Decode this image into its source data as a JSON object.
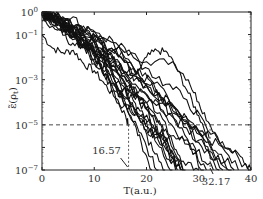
{
  "chart_data": {
    "type": "line",
    "title": "",
    "xlabel": "T(a.u.)",
    "ylabel": "ε̃(ρ_t)",
    "xlim": [
      0,
      40
    ],
    "ylim_log10": [
      -7,
      0
    ],
    "yscale": "log",
    "x_ticks": [
      "0",
      "10",
      "20",
      "30",
      "40"
    ],
    "y_ticks": [
      {
        "base": "10",
        "exp": "0",
        "log": 0
      },
      {
        "base": "10",
        "exp": "−1",
        "log": -1
      },
      {
        "base": "10",
        "exp": "−3",
        "log": -3
      },
      {
        "base": "10",
        "exp": "−5",
        "log": -5
      },
      {
        "base": "10",
        "exp": "−7",
        "log": -7
      }
    ],
    "threshold_line": {
      "y": 1e-05,
      "style": "dashed"
    },
    "annotations": [
      {
        "text": "16.57",
        "x": 16.57,
        "style": "dashed-vertical"
      },
      {
        "text": "32.17",
        "x": 32.17,
        "style": "dashed-vertical"
      }
    ],
    "series_description": "Many (~25) noisy decaying trajectories starting near 10^0 at T=0, falling to 10^-7 between T≈16 and T≈40",
    "series": [
      {
        "name": "fastest",
        "x": [
          0,
          2,
          4,
          6,
          8,
          10,
          12,
          14,
          16,
          16.57
        ],
        "log10_y": [
          -1,
          -1.6,
          -1.8,
          -1.7,
          -2.3,
          -2.6,
          -3.2,
          -3.8,
          -4.6,
          -5
        ]
      },
      {
        "name": "second",
        "x": [
          0,
          3,
          5,
          7,
          9,
          11,
          13,
          15,
          17,
          19,
          21
        ],
        "log10_y": [
          -0.4,
          -0.8,
          -1.0,
          -1.0,
          -1.6,
          -2.3,
          -2.8,
          -3.6,
          -4.6,
          -5.8,
          -7
        ]
      },
      {
        "name": "bulk-upper",
        "x": [
          0,
          5,
          10,
          15,
          20,
          25,
          28,
          30,
          32.17,
          35,
          38,
          40
        ],
        "log10_y": [
          0,
          -0.5,
          -1.0,
          -1.6,
          -2.2,
          -2.2,
          -3.0,
          -4.0,
          -5,
          -6,
          -6.4,
          -7
        ]
      },
      {
        "name": "bump",
        "x": [
          0,
          5,
          10,
          15,
          18,
          20,
          22,
          24,
          26,
          28,
          30,
          32
        ],
        "log10_y": [
          0,
          -0.6,
          -1.2,
          -2.0,
          -2.8,
          -2.0,
          -1.7,
          -1.8,
          -2.6,
          -3.6,
          -4.6,
          -5.6
        ]
      },
      {
        "name": "bulk-lower",
        "x": [
          0,
          5,
          10,
          15,
          20,
          23,
          25,
          27,
          30
        ],
        "log10_y": [
          -0.1,
          -1.0,
          -1.8,
          -2.8,
          -4.0,
          -5,
          -5.8,
          -6.6,
          -7
        ]
      }
    ]
  }
}
